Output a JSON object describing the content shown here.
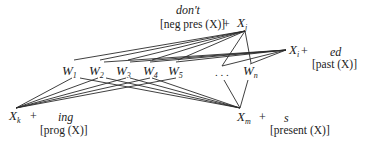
{
  "nodes": {
    "Xj": {
      "base": "X",
      "sub": "j",
      "x": 237,
      "y": 17
    },
    "Xi": {
      "base": "X",
      "sub": "i",
      "x": 290,
      "y": 46
    },
    "Xk": {
      "base": "X",
      "sub": "k",
      "x": 10,
      "y": 110
    },
    "Xm": {
      "base": "X",
      "sub": "m",
      "x": 238,
      "y": 111
    },
    "W1": {
      "base": "W",
      "sub": "1",
      "x": 62,
      "y": 66
    },
    "W2": {
      "base": "W",
      "sub": "2",
      "x": 89,
      "y": 66
    },
    "W3": {
      "base": "W",
      "sub": "3",
      "x": 116,
      "y": 66
    },
    "W4": {
      "base": "W",
      "sub": "4",
      "x": 143,
      "y": 66
    },
    "W5": {
      "base": "W",
      "sub": "5",
      "x": 168,
      "y": 66
    },
    "ellipsis": {
      "text": ". . .",
      "x": 216,
      "y": 70
    },
    "Wn": {
      "base": "W",
      "sub": "n",
      "x": 243,
      "y": 66
    }
  },
  "affixes": {
    "dont": {
      "morph": "don't",
      "gloss": "[neg pres (X)]",
      "plus": "+"
    },
    "ed": {
      "morph": "ed",
      "gloss": "[past (X)]",
      "plus": "+"
    },
    "ing": {
      "morph": "ing",
      "gloss": "[prog (X)]",
      "plus": "+"
    },
    "s": {
      "morph": "s",
      "gloss": "[present (X)]",
      "plus": "+"
    }
  },
  "edges": [
    {
      "from": "Xj",
      "to": [
        "W1",
        "W2",
        "W3",
        "W4",
        "W5",
        "ellipsis",
        "Wn"
      ]
    },
    {
      "from": "Xi",
      "to": [
        "W2",
        "W3",
        "W4",
        "W5",
        "ellipsis",
        "Wn"
      ]
    },
    {
      "from": "Xk",
      "to": [
        "W1",
        "W2",
        "W3",
        "W4",
        "W5"
      ]
    },
    {
      "from": "Xm",
      "to": [
        "W1",
        "W2",
        "W3",
        "W4",
        "ellipsis",
        "Wn"
      ]
    }
  ]
}
